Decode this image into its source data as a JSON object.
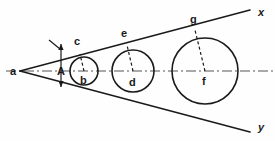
{
  "figure": {
    "background_color": "#fefefe",
    "stroke_color": "#1a1a1a",
    "centerline_color": "#555555",
    "width": 275,
    "height": 141
  },
  "apex": {
    "label": "a",
    "x": 20,
    "y": 71,
    "label_x": 10,
    "label_y": 75
  },
  "rays": [
    {
      "name": "upper-ray",
      "label": "x",
      "label_x": 258,
      "label_y": 16,
      "x1": 20,
      "y1": 71,
      "x2": 250,
      "y2": 10
    },
    {
      "name": "lower-ray",
      "label": "y",
      "label_x": 258,
      "label_y": 131,
      "x1": 20,
      "y1": 71,
      "x2": 250,
      "y2": 132
    }
  ],
  "centerline": {
    "name": "axis-of-symmetry",
    "x1": 6,
    "y1": 71,
    "x2": 273,
    "y2": 71,
    "dash_pattern": "10 3 2 3"
  },
  "angle_marker": {
    "label": "A",
    "label_x": 57,
    "label_y": 75,
    "arrow_x": 61,
    "arrow_top_y": 44,
    "arrow_bottom_y": 87,
    "tick_x1": 49,
    "tick_y1": 40,
    "tick_x2": 60,
    "tick_y2": 49
  },
  "circles": [
    {
      "name": "circle-1",
      "center_label": "b",
      "cx": 84,
      "cy": 71,
      "r": 14,
      "center_label_x": 80,
      "center_label_y": 84,
      "tangent_label": "c",
      "tangent_x": 80,
      "tangent_y": 54,
      "tangent_label_x": 74,
      "tangent_label_y": 45
    },
    {
      "name": "circle-2",
      "center_label": "d",
      "cx": 133,
      "cy": 71,
      "r": 21,
      "center_label_x": 129,
      "center_label_y": 86,
      "tangent_label": "e",
      "tangent_x": 127,
      "tangent_y": 45,
      "tangent_label_x": 121,
      "tangent_label_y": 37
    },
    {
      "name": "circle-3",
      "center_label": "f",
      "cx": 205,
      "cy": 71,
      "r": 33,
      "center_label_x": 202,
      "center_label_y": 85,
      "tangent_label": "g",
      "tangent_x": 195,
      "tangent_y": 30,
      "tangent_label_x": 190,
      "tangent_label_y": 23
    }
  ]
}
